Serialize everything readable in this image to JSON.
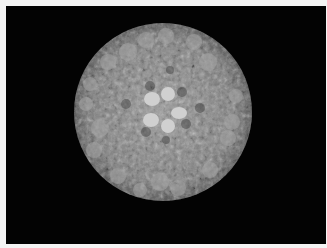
{
  "image": {
    "subject": "icosahedral virus capsid, grayscale surface rendering",
    "background_color": "#030303",
    "border_color": "#f4f4f4",
    "sphere": {
      "cx": 163,
      "cy": 112,
      "r": 89,
      "base_color": "#8a8a8a"
    },
    "central_pentamer": {
      "cx": 164,
      "cy": 111,
      "petals": 5,
      "color": "#d2d2d2"
    },
    "bright_patches": [
      {
        "x": 128,
        "y": 52
      },
      {
        "x": 194,
        "y": 42
      },
      {
        "x": 208,
        "y": 62
      },
      {
        "x": 108,
        "y": 62
      },
      {
        "x": 100,
        "y": 128
      },
      {
        "x": 94,
        "y": 150
      },
      {
        "x": 232,
        "y": 122
      },
      {
        "x": 228,
        "y": 138
      },
      {
        "x": 160,
        "y": 182
      },
      {
        "x": 178,
        "y": 188
      }
    ]
  }
}
